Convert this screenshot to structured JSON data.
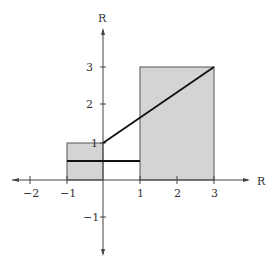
{
  "axes": {
    "x_label": "R",
    "y_label": "R",
    "x_ticks": [
      "−2",
      "−1",
      "1",
      "2",
      "3"
    ],
    "y_ticks": [
      "3",
      "2",
      "1",
      "−1"
    ]
  },
  "regions": [
    {
      "name": "left-rectangle",
      "x": [
        -1,
        0
      ],
      "y": [
        0,
        1
      ]
    },
    {
      "name": "right-rectangle",
      "x": [
        1,
        3
      ],
      "y": [
        0,
        3
      ]
    }
  ],
  "lines": [
    {
      "name": "horizontal-segment",
      "from": [
        -1,
        0.5
      ],
      "to": [
        1,
        0.5
      ]
    },
    {
      "name": "diagonal-segment",
      "from": [
        0,
        1
      ],
      "to": [
        3,
        3
      ]
    }
  ],
  "colors": {
    "fill": "#d4d4d4",
    "stroke": "#111111",
    "axis": "#444444"
  }
}
